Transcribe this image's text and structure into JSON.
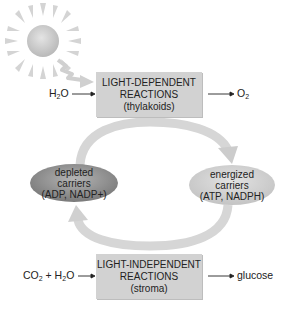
{
  "diagram": {
    "colors": {
      "box_fill": "#d2d2d2",
      "cycle_arrow": "#d6d6d6",
      "depleted_fill": "#8e8e8e",
      "energized_fill": "#d4d4d4",
      "sun": "#c8c8c8",
      "text": "#222222"
    },
    "light_dependent": {
      "line1": "LIGHT-DEPENDENT",
      "line2": "REACTIONS",
      "line3": "(thylakoids)",
      "input": {
        "base": "H",
        "sub": "2",
        "rest": "O"
      },
      "output": {
        "base": "O",
        "sub": "2"
      }
    },
    "light_independent": {
      "line1": "LIGHT-INDEPENDENT",
      "line2": "REACTIONS",
      "line3": "(stroma)",
      "input": {
        "a": "CO",
        "a_sub": "2",
        "plus": " + H",
        "b_sub": "2",
        "b_rest": "O"
      },
      "output": "glucose"
    },
    "depleted": {
      "line1": "depleted",
      "line2": "carriers",
      "line3": "(ADP, NADP+)"
    },
    "energized": {
      "line1": "energized",
      "line2": "carriers",
      "line3": "(ATP, NADPH)"
    },
    "icons": [
      "sun-icon",
      "light-ray-arrow-icon",
      "cycle-arrow-top-icon",
      "cycle-arrow-bottom-icon"
    ]
  }
}
